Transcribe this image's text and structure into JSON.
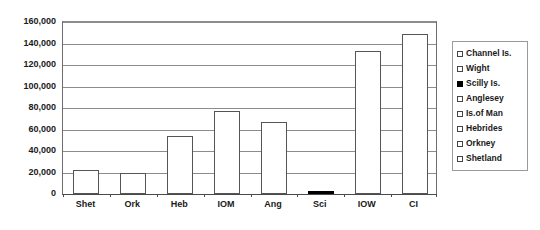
{
  "chart_data": {
    "type": "bar",
    "title": "",
    "subtitle": "",
    "xlabel": "",
    "ylabel": "",
    "categories": [
      "Shet",
      "Ork",
      "Heb",
      "IOM",
      "Ang",
      "Sci",
      "IOW",
      "CI"
    ],
    "values": [
      22000,
      19500,
      54000,
      77000,
      67000,
      2000,
      133000,
      149000
    ],
    "series": [
      {
        "name": "Population",
        "values": [
          22000,
          19500,
          54000,
          77000,
          67000,
          2000,
          133000,
          149000
        ]
      }
    ],
    "ylim": [
      0,
      160000
    ],
    "ytick_values": [
      0,
      20000,
      40000,
      60000,
      80000,
      100000,
      120000,
      140000,
      160000
    ],
    "ytick_labels": [
      "0",
      "20,000",
      "40,000",
      "60,000",
      "80,000",
      "100,000",
      "120,000",
      "140,000",
      "160,000"
    ],
    "grid": true,
    "grid_axis": "y",
    "legend_position": "right",
    "bar_style": {
      "fill": "#ffffff",
      "edge": "#555555",
      "highlight_fill": "#000000"
    },
    "highlighted_category": "Sci",
    "legend": [
      {
        "label": "Channel Is.",
        "swatch": "open",
        "color": "#ffffff"
      },
      {
        "label": "Wight",
        "swatch": "open",
        "color": "#ffffff"
      },
      {
        "label": "Scilly Is.",
        "swatch": "filled",
        "color": "#000000"
      },
      {
        "label": "Anglesey",
        "swatch": "open",
        "color": "#ffffff"
      },
      {
        "label": "Is.of Man",
        "swatch": "open",
        "color": "#ffffff"
      },
      {
        "label": "Hebrides",
        "swatch": "open",
        "color": "#ffffff"
      },
      {
        "label": "Orkney",
        "swatch": "open",
        "color": "#ffffff"
      },
      {
        "label": "Shetland",
        "swatch": "open",
        "color": "#ffffff"
      }
    ]
  }
}
